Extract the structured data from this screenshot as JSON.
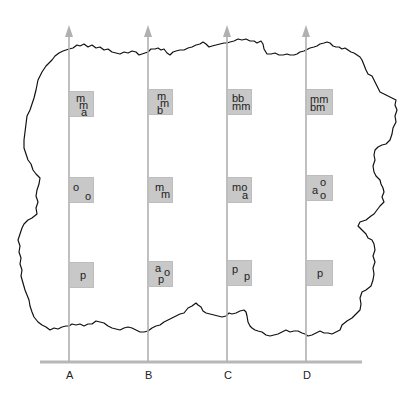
{
  "diagram": {
    "colors": {
      "background": "#ffffff",
      "arrow": "#b0b0b0",
      "baseline": "#b8b8b8",
      "box_fill": "#c8c8c8",
      "outline": "#111111",
      "text": "#222222"
    },
    "axis": {
      "labels": [
        "A",
        "B",
        "C",
        "D"
      ]
    },
    "columns": [
      {
        "label": "A",
        "boxes": [
          {
            "row": 1,
            "tokens": [
              "m",
              "m",
              "a"
            ]
          },
          {
            "row": 2,
            "tokens": [
              "o",
              "o"
            ]
          },
          {
            "row": 3,
            "tokens": [
              "p"
            ]
          }
        ]
      },
      {
        "label": "B",
        "boxes": [
          {
            "row": 1,
            "tokens": [
              "m",
              "m",
              "b"
            ]
          },
          {
            "row": 2,
            "tokens": [
              "m",
              "m"
            ]
          },
          {
            "row": 3,
            "tokens": [
              "a",
              "o",
              "p"
            ]
          }
        ]
      },
      {
        "label": "C",
        "boxes": [
          {
            "row": 1,
            "tokens": [
              "bb",
              "mm"
            ]
          },
          {
            "row": 2,
            "tokens": [
              "mo",
              "a"
            ]
          },
          {
            "row": 3,
            "tokens": [
              "p",
              "p"
            ]
          }
        ]
      },
      {
        "label": "D",
        "boxes": [
          {
            "row": 1,
            "tokens": [
              "mm",
              "bm"
            ]
          },
          {
            "row": 2,
            "tokens": [
              "a",
              "o",
              "o"
            ]
          },
          {
            "row": 3,
            "tokens": [
              "p"
            ]
          }
        ]
      }
    ]
  }
}
